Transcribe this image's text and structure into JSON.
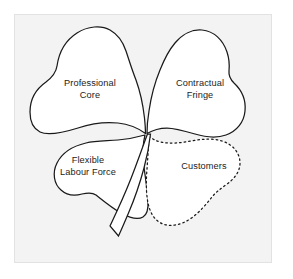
{
  "figure": {
    "panel": {
      "background_color": "#f3f3f3",
      "border_color": "#e2e2e2",
      "outer_background_color": "#ffffff"
    },
    "outline_color": "#1a1a1a",
    "leaf_fill_color": "#ffffff",
    "text_color": "#1c1c1c"
  },
  "leaves": [
    {
      "id": "professional-core",
      "label_line_1": "Professional",
      "label_line_2": "Core",
      "position": "top-left",
      "outline_style": "solid"
    },
    {
      "id": "contractual-fringe",
      "label_line_1": "Contractual",
      "label_line_2": "Fringe",
      "position": "top-right",
      "outline_style": "solid"
    },
    {
      "id": "flexible-labour-force",
      "label_line_1": "Flexible",
      "label_line_2": "Labour Force",
      "position": "bottom-left",
      "outline_style": "solid"
    },
    {
      "id": "customers",
      "label_line_1": "Customers",
      "label_line_2": "",
      "position": "bottom-right",
      "outline_style": "dotted"
    }
  ],
  "stem": {
    "id": "shamrock-stem",
    "outline_style": "solid"
  }
}
